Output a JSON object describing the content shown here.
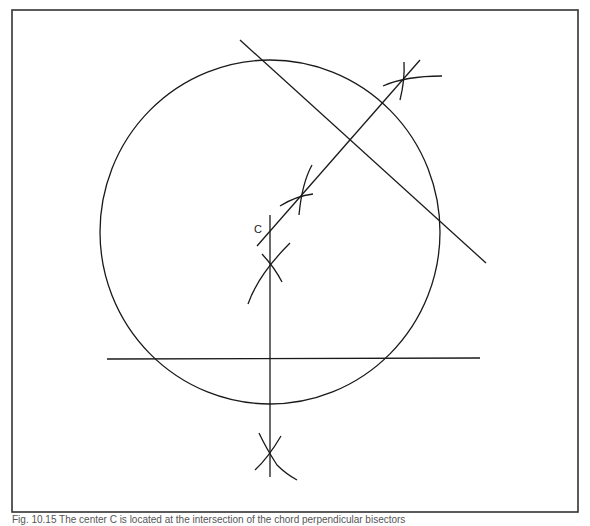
{
  "figure": {
    "caption": "Fig. 10.15 The center C is located at the intersection of the chord perpendicular bisectors",
    "center_label": "C",
    "stroke_color": "#1a1a1a",
    "frame_color": "#333333"
  },
  "geometry": {
    "frame": {
      "x": 12,
      "y": 10,
      "width": 566,
      "height": 502
    },
    "circle": {
      "cx": 270,
      "cy": 232,
      "rx": 170,
      "ry": 172
    },
    "chord_horizontal": {
      "x1": 107,
      "y1": 359,
      "x2": 480,
      "y2": 358
    },
    "bisector_vertical": {
      "x1": 270,
      "y1": 215,
      "x2": 270,
      "y2": 477
    },
    "chord_diagonal": {
      "x1": 240,
      "y1": 40,
      "x2": 486,
      "y2": 263
    },
    "bisector_diagonal": {
      "x1": 257,
      "y1": 246,
      "x2": 420,
      "y2": 60
    },
    "center_point": {
      "x": 270,
      "y": 232
    }
  }
}
